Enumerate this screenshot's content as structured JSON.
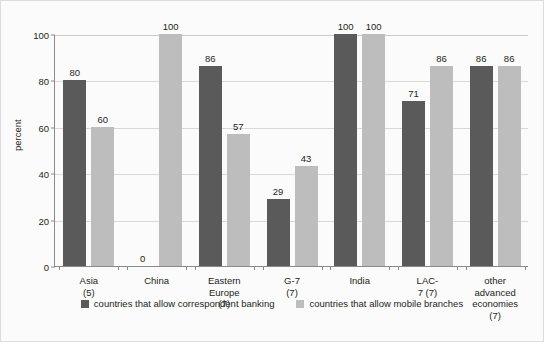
{
  "chart_data": {
    "type": "bar",
    "title": "",
    "xlabel": "",
    "ylabel": "percent",
    "ylim": [
      0,
      100
    ],
    "yticks": [
      0,
      20,
      40,
      60,
      80,
      100
    ],
    "grid": true,
    "legend_position": "bottom-center",
    "categories": [
      "Asia (5)",
      "China",
      "Eastern\nEurope (7)",
      "G-7 (7)",
      "India",
      "LAC-7 (7)",
      "other\nadvanced\neconomies (7)"
    ],
    "series": [
      {
        "name": "countries that allow correspondent banking",
        "color": "#5a5a5a",
        "values": [
          80,
          0,
          86,
          29,
          100,
          71,
          86
        ]
      },
      {
        "name": "countries that allow mobile branches",
        "color": "#bdbdbd",
        "values": [
          60,
          100,
          57,
          43,
          100,
          86,
          86
        ]
      }
    ]
  },
  "axis": {
    "y_title": "percent",
    "y_tick_labels": [
      "0",
      "20",
      "40",
      "60",
      "80",
      "100"
    ]
  },
  "legend": {
    "items": [
      {
        "label": "countries that allow correspondent banking",
        "color": "#5a5a5a"
      },
      {
        "label": "countries that allow mobile branches",
        "color": "#bdbdbd"
      }
    ]
  },
  "colors": {
    "series_dark": "#5a5a5a",
    "series_light": "#bdbdbd",
    "axis": "#8a8a8a",
    "grid": "#d9d9d9",
    "background": "#fbfbfb",
    "text": "#231f20"
  }
}
